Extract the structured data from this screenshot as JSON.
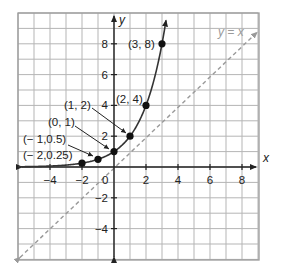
{
  "chart_data": {
    "type": "line",
    "title": "",
    "xlabel": "x",
    "ylabel": "y",
    "xlim": [
      -6,
      9
    ],
    "ylim": [
      -6,
      10
    ],
    "grid": true,
    "x_ticks": [
      -4,
      -2,
      2,
      4,
      6,
      8
    ],
    "y_ticks": [
      -4,
      -2,
      2,
      4,
      6,
      8
    ],
    "origin_label": "0",
    "series": [
      {
        "name": "y = 2^x",
        "style": "solid",
        "color": "#333333",
        "points": [
          {
            "x": -2,
            "y": 0.25,
            "label": "(− 2,0.25)"
          },
          {
            "x": -1,
            "y": 0.5,
            "label": "(− 1,0.5)"
          },
          {
            "x": 0,
            "y": 1,
            "label": "(0, 1)"
          },
          {
            "x": 1,
            "y": 2,
            "label": "(1, 2)"
          },
          {
            "x": 2,
            "y": 4,
            "label": "(2, 4)"
          },
          {
            "x": 3,
            "y": 8,
            "label": "(3, 8)"
          }
        ]
      },
      {
        "name": "y = x",
        "style": "dashed",
        "color": "#9a9a9a",
        "label": "y = x",
        "x": [
          -6,
          9
        ],
        "y": [
          -6,
          9
        ]
      }
    ]
  },
  "labels": {
    "x_axis": "x",
    "y_axis": "y",
    "origin": "0",
    "ref_line": "y = x",
    "x_ticks": [
      "−4",
      "−2",
      "2",
      "4",
      "6",
      "8"
    ],
    "y_ticks": [
      "8",
      "6",
      "4",
      "2",
      "−2",
      "−4"
    ],
    "points": [
      "(− 2,0.25)",
      "(− 1,0.5)",
      "(0, 1)",
      "(1, 2)",
      "(2, 4)",
      "(3, 8)"
    ]
  }
}
